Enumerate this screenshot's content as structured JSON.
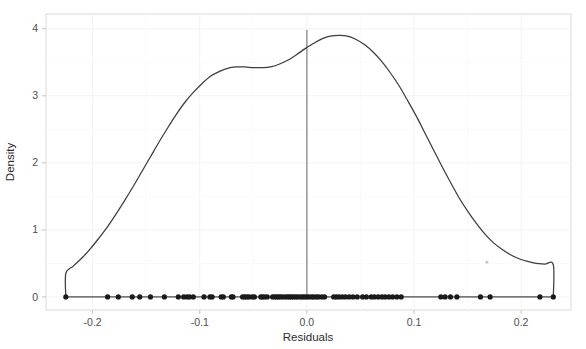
{
  "chart_data": {
    "type": "area",
    "plot_kind": "density-with-rug",
    "title": "",
    "subtitle": "",
    "xlabel": "Residuals",
    "ylabel": "Density",
    "xlim": [
      -0.2435,
      0.2465
    ],
    "ylim": [
      -0.195,
      4.22
    ],
    "xticks": [
      -0.2,
      -0.1,
      0.0,
      0.1,
      0.2
    ],
    "xticklabels": [
      "-0.2",
      "-0.1",
      "0.0",
      "0.1",
      "0.2"
    ],
    "yticks": [
      0,
      1,
      2,
      3,
      4
    ],
    "yticklabels": [
      "0",
      "1",
      "2",
      "3",
      "4"
    ],
    "grid": "faint-minor-and-major",
    "legend": "none",
    "annotations": [
      {
        "name": "zero-reference-line",
        "type": "vline",
        "x": 0.0,
        "color": "#808080"
      },
      {
        "name": "faint-artifact-dot",
        "x": 0.168,
        "y": 0.52
      }
    ],
    "colors": {
      "density_curve": "#3d3d3d",
      "rug_points": "#1a1a1a",
      "zero_line": "#8c8c8c",
      "panel_border": "#d9d9d9",
      "grid": "#f2f2f2",
      "background": "#ffffff",
      "tick_label": "#4d4d4d",
      "axis_title": "#2b2b2b"
    },
    "series": [
      {
        "name": "Density",
        "type": "line",
        "x": [
          -0.225,
          -0.225,
          -0.218,
          -0.21,
          -0.202,
          -0.194,
          -0.186,
          -0.178,
          -0.17,
          -0.162,
          -0.154,
          -0.146,
          -0.138,
          -0.13,
          -0.122,
          -0.114,
          -0.106,
          -0.098,
          -0.09,
          -0.082,
          -0.074,
          -0.066,
          -0.058,
          -0.05,
          -0.042,
          -0.034,
          -0.026,
          -0.018,
          -0.01,
          -0.002,
          0.006,
          0.014,
          0.022,
          0.03,
          0.038,
          0.046,
          0.054,
          0.062,
          0.07,
          0.078,
          0.086,
          0.094,
          0.102,
          0.11,
          0.118,
          0.126,
          0.134,
          0.142,
          0.15,
          0.158,
          0.166,
          0.174,
          0.182,
          0.19,
          0.198,
          0.206,
          0.214,
          0.222,
          0.23,
          0.23
        ],
        "y": [
          0.0,
          0.35,
          0.46,
          0.58,
          0.72,
          0.88,
          1.05,
          1.24,
          1.44,
          1.65,
          1.87,
          2.09,
          2.31,
          2.52,
          2.72,
          2.9,
          3.05,
          3.18,
          3.29,
          3.36,
          3.41,
          3.43,
          3.43,
          3.42,
          3.42,
          3.43,
          3.47,
          3.53,
          3.61,
          3.7,
          3.78,
          3.85,
          3.89,
          3.9,
          3.89,
          3.84,
          3.76,
          3.65,
          3.51,
          3.34,
          3.15,
          2.93,
          2.7,
          2.45,
          2.2,
          1.95,
          1.71,
          1.48,
          1.28,
          1.1,
          0.94,
          0.81,
          0.71,
          0.63,
          0.57,
          0.53,
          0.5,
          0.49,
          0.48,
          0.0
        ]
      },
      {
        "name": "Residual observations (rug)",
        "type": "scatter",
        "y_value": 0.0,
        "x": [
          -0.225,
          -0.186,
          -0.176,
          -0.163,
          -0.156,
          -0.146,
          -0.133,
          -0.12,
          -0.115,
          -0.112,
          -0.1095,
          -0.106,
          -0.096,
          -0.0905,
          -0.0885,
          -0.08,
          -0.078,
          -0.0705,
          -0.069,
          -0.06,
          -0.058,
          -0.056,
          -0.054,
          -0.051,
          -0.049,
          -0.043,
          -0.0415,
          -0.0395,
          -0.037,
          -0.032,
          -0.03,
          -0.028,
          -0.0265,
          -0.0245,
          -0.0225,
          -0.02,
          -0.018,
          -0.016,
          -0.0145,
          -0.0125,
          -0.0105,
          -0.0085,
          -0.006,
          -0.004,
          -0.002,
          0.0,
          0.002,
          0.0045,
          0.0065,
          0.009,
          0.011,
          0.014,
          0.0165,
          0.025,
          0.0275,
          0.03,
          0.033,
          0.036,
          0.0395,
          0.043,
          0.047,
          0.052,
          0.0555,
          0.06,
          0.063,
          0.0665,
          0.07,
          0.073,
          0.0765,
          0.08,
          0.084,
          0.088,
          0.125,
          0.129,
          0.134,
          0.14,
          0.162,
          0.171,
          0.2175,
          0.23
        ]
      }
    ]
  },
  "axes": {
    "x_title": "Residuals",
    "y_title": "Density",
    "x_tick_labels": [
      "-0.2",
      "-0.1",
      "0.0",
      "0.1",
      "0.2"
    ],
    "y_tick_labels": [
      "0",
      "1",
      "2",
      "3",
      "4"
    ]
  }
}
